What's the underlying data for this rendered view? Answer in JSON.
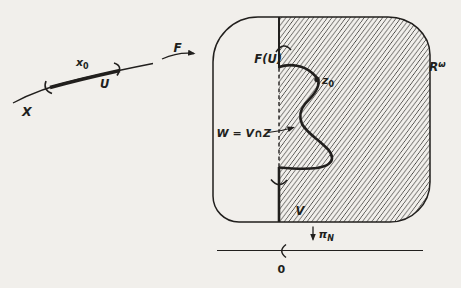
{
  "colors": {
    "paper": "#f1efeb",
    "ink": "#211f1d"
  },
  "domain": {
    "curve_label": "X",
    "point_label": {
      "base": "x",
      "sub": "0"
    },
    "neighborhood_label": "U"
  },
  "map": {
    "label": "F"
  },
  "codomain": {
    "space_label": {
      "base": "R",
      "sup": "ω"
    },
    "image_label": "F(U)",
    "point_label": {
      "base": "z",
      "sub": "0"
    },
    "intersection_label": "W = V∩Z",
    "neighborhood_label": "V"
  },
  "projection": {
    "label": {
      "base": "π",
      "sub": "N"
    },
    "origin_label": "0"
  }
}
